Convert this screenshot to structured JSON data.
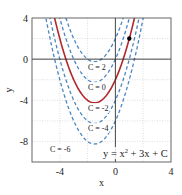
{
  "chart_data": {
    "type": "line",
    "title": "",
    "xlabel": "x",
    "ylabel": "y",
    "xlim": [
      -6,
      4
    ],
    "ylim": [
      -10,
      4
    ],
    "xticks": [
      -4,
      0,
      4
    ],
    "yticks": [
      4,
      0,
      -4,
      -8
    ],
    "grid": true,
    "equation_label": "y = x² + 3x + C",
    "function": "y = x^2 + 3x + C",
    "series": [
      {
        "name": "C = 2",
        "C": 2,
        "style": "dashed",
        "color": "#4a86c0",
        "vertex": [
          -1.5,
          -0.25
        ]
      },
      {
        "name": "C = 0",
        "C": 0,
        "style": "dashed",
        "color": "#4a86c0",
        "vertex": [
          -1.5,
          -2.25
        ]
      },
      {
        "name": "C = -2",
        "C": -2,
        "style": "solid",
        "color": "#b0282c",
        "vertex": [
          -1.5,
          -4.25
        ]
      },
      {
        "name": "C = -4",
        "C": -4,
        "style": "dashed",
        "color": "#4a86c0",
        "vertex": [
          -1.5,
          -6.25
        ]
      },
      {
        "name": "C = -6",
        "C": -6,
        "style": "dashed",
        "color": "#4a86c0",
        "vertex": [
          -1.5,
          -8.25
        ]
      }
    ],
    "highlight_point": {
      "x": 1,
      "y": 2,
      "color": "#000000"
    },
    "curve_labels": [
      "C = 2",
      "C = 0",
      "C = -2",
      "C = -4",
      "C = -6"
    ]
  }
}
